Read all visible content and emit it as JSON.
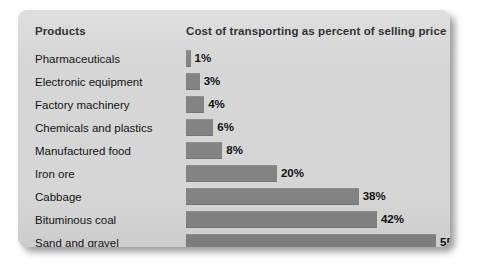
{
  "panel": {
    "background_color": "#d6d6d6",
    "bar_color": "#838383",
    "text_color": "#111111"
  },
  "header": {
    "products_label": "Products",
    "measure_label": "Cost of transporting as percent of selling price"
  },
  "chart_data": {
    "type": "bar",
    "orientation": "horizontal",
    "title": "",
    "xlabel": "Cost of transporting as percent of selling price",
    "ylabel": "Products",
    "xlim": [
      0,
      55
    ],
    "grid": false,
    "legend": null,
    "value_suffix": "%",
    "categories": [
      "Pharmaceuticals",
      "Electronic equipment",
      "Factory machinery",
      "Chemicals and plastics",
      "Manufactured food",
      "Iron ore",
      "Cabbage",
      "Bituminous coal",
      "Sand and gravel"
    ],
    "values": [
      1,
      3,
      4,
      6,
      8,
      20,
      38,
      42,
      55
    ],
    "value_labels": [
      "1%",
      "3%",
      "4%",
      "6%",
      "8%",
      "20%",
      "38%",
      "42%",
      "55%"
    ],
    "rows": [
      {
        "label": "Pharmaceuticals",
        "value": 1,
        "value_label": "1%"
      },
      {
        "label": "Electronic equipment",
        "value": 3,
        "value_label": "3%"
      },
      {
        "label": "Factory machinery",
        "value": 4,
        "value_label": "4%"
      },
      {
        "label": "Chemicals and plastics",
        "value": 6,
        "value_label": "6%"
      },
      {
        "label": "Manufactured food",
        "value": 8,
        "value_label": "8%"
      },
      {
        "label": "Iron ore",
        "value": 20,
        "value_label": "20%"
      },
      {
        "label": "Cabbage",
        "value": 38,
        "value_label": "38%"
      },
      {
        "label": "Bituminous coal",
        "value": 42,
        "value_label": "42%"
      },
      {
        "label": "Sand and gravel",
        "value": 55,
        "value_label": "55%"
      }
    ]
  }
}
